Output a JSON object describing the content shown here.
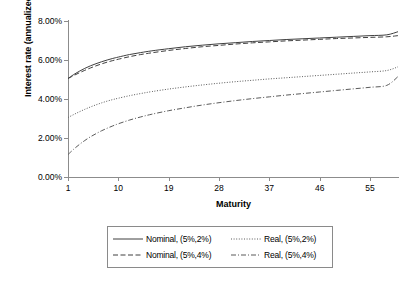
{
  "chart_data": {
    "type": "line",
    "title": "",
    "xlabel": "Maturity",
    "ylabel": "Interest rate (annualized)",
    "xlim": [
      1,
      60
    ],
    "ylim": [
      0,
      0.08
    ],
    "ylim_percent": [
      0,
      8
    ],
    "grid": false,
    "legend_position": "bottom-outside",
    "xticks": [
      1,
      10,
      19,
      28,
      37,
      46,
      55
    ],
    "xtick_labels": [
      "1",
      "10",
      "19",
      "28",
      "37",
      "46",
      "55"
    ],
    "yticks": [
      0,
      2,
      4,
      6,
      8
    ],
    "ytick_labels": [
      "0.00%",
      "2.00%",
      "4.00%",
      "6.00%",
      "8.00%"
    ],
    "x": [
      1,
      2,
      3,
      4,
      5,
      6,
      7,
      8,
      9,
      10,
      12,
      14,
      16,
      19,
      22,
      25,
      28,
      31,
      34,
      37,
      40,
      43,
      46,
      49,
      52,
      55,
      58,
      60
    ],
    "series": [
      {
        "name": "Nominal, (5%,2%)",
        "linestyle": "solid",
        "color": "#3f3f3f",
        "values": [
          5.05,
          5.25,
          5.42,
          5.57,
          5.7,
          5.81,
          5.91,
          6.0,
          6.08,
          6.15,
          6.28,
          6.38,
          6.47,
          6.58,
          6.68,
          6.76,
          6.83,
          6.89,
          6.95,
          7.0,
          7.05,
          7.09,
          7.13,
          7.17,
          7.21,
          7.25,
          7.29,
          7.45
        ]
      },
      {
        "name": "Nominal, (5%,4%)",
        "linestyle": "dashed",
        "color": "#3f3f3f",
        "values": [
          5.05,
          5.2,
          5.34,
          5.47,
          5.59,
          5.7,
          5.8,
          5.89,
          5.97,
          6.04,
          6.17,
          6.28,
          6.37,
          6.49,
          6.59,
          6.68,
          6.75,
          6.82,
          6.88,
          6.93,
          6.98,
          7.02,
          7.06,
          7.1,
          7.13,
          7.16,
          7.19,
          7.25
        ]
      },
      {
        "name": "Real, (5%,2%)",
        "linestyle": "dotted",
        "color": "#5a5a5a",
        "values": [
          3.05,
          3.2,
          3.34,
          3.47,
          3.59,
          3.7,
          3.8,
          3.89,
          3.97,
          4.04,
          4.17,
          4.28,
          4.38,
          4.51,
          4.62,
          4.72,
          4.81,
          4.89,
          4.96,
          5.03,
          5.09,
          5.15,
          5.21,
          5.27,
          5.33,
          5.39,
          5.46,
          5.65
        ]
      },
      {
        "name": "Real, (5%,4%)",
        "linestyle": "dashdot",
        "color": "#5a5a5a",
        "values": [
          1.15,
          1.42,
          1.66,
          1.87,
          2.06,
          2.22,
          2.37,
          2.5,
          2.62,
          2.73,
          2.92,
          3.08,
          3.22,
          3.4,
          3.55,
          3.69,
          3.81,
          3.92,
          4.02,
          4.11,
          4.2,
          4.28,
          4.36,
          4.44,
          4.52,
          4.6,
          4.7,
          5.15
        ]
      }
    ]
  },
  "legend": {
    "entries": [
      {
        "label": "Nominal, (5%,2%)",
        "style": "solid"
      },
      {
        "label": "Real, (5%,2%)",
        "style": "dotted"
      },
      {
        "label": "Nominal, (5%,4%)",
        "style": "dashed"
      },
      {
        "label": "Real, (5%,4%)",
        "style": "dashdot"
      }
    ]
  }
}
